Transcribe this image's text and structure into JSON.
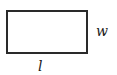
{
  "diagram": {
    "shape": "rectangle",
    "labels": {
      "width": "w",
      "length": "l"
    },
    "colors": {
      "stroke": "#2a2a2a",
      "background": "#ffffff"
    }
  }
}
